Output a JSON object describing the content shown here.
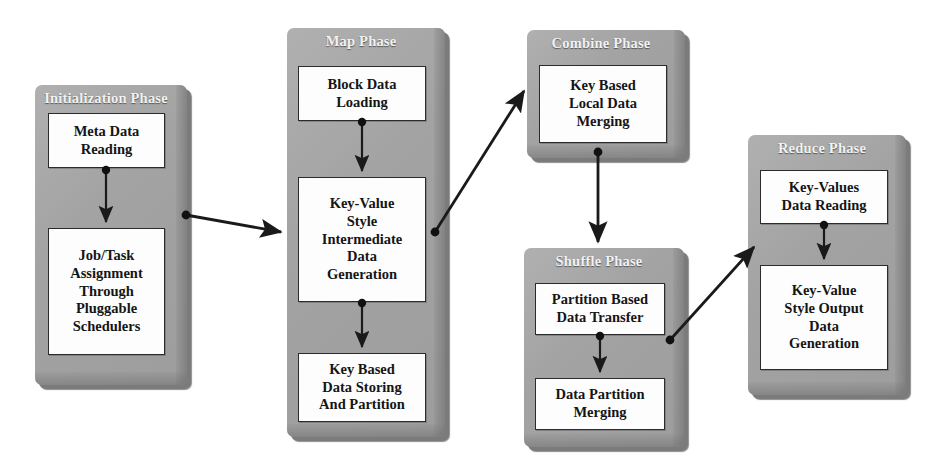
{
  "diagram": {
    "background_color": "#ffffff",
    "panel_color": "#a8a8a8",
    "panel_shadow_color": "#7b7b7b",
    "node_fill_color": "#fdfdfd",
    "node_border_color": "#2b2b2b",
    "arrow_color": "#1a1a1a",
    "title_text_color": "#f2f2f2"
  },
  "phases": [
    {
      "id": "initialization",
      "title": "Initialization Phase",
      "nodes": [
        {
          "id": "meta-data-reading",
          "label": "Meta Data\nReading"
        },
        {
          "id": "job-task-assignment",
          "label": "Job/Task\nAssignment\nThrough\nPluggable\nSchedulers"
        }
      ]
    },
    {
      "id": "map",
      "title": "Map Phase",
      "nodes": [
        {
          "id": "block-data-loading",
          "label": "Block Data\nLoading"
        },
        {
          "id": "key-value-intermediate",
          "label": "Key-Value\nStyle\nIntermediate\nData\nGeneration"
        },
        {
          "id": "key-based-data-storing",
          "label": "Key Based\nData Storing\nAnd Partition"
        }
      ]
    },
    {
      "id": "combine",
      "title": "Combine Phase",
      "nodes": [
        {
          "id": "key-based-local-merging",
          "label": "Key Based\nLocal Data\nMerging"
        }
      ]
    },
    {
      "id": "shuffle",
      "title": "Shuffle Phase",
      "nodes": [
        {
          "id": "partition-based-transfer",
          "label": "Partition Based\nData Transfer"
        },
        {
          "id": "data-partition-merging",
          "label": "Data Partition\nMerging"
        }
      ]
    },
    {
      "id": "reduce",
      "title": "Reduce Phase",
      "nodes": [
        {
          "id": "key-values-data-reading",
          "label": "Key-Values\nData Reading"
        },
        {
          "id": "key-value-output-generation",
          "label": "Key-Value\nStyle Output\nData\nGeneration"
        }
      ]
    }
  ],
  "connections": [
    {
      "id": "init-to-map",
      "from": "job-task-assignment",
      "to": "key-value-intermediate",
      "kind": "inter-phase"
    },
    {
      "id": "map-to-combine",
      "from": "key-value-intermediate",
      "to": "key-based-local-merging",
      "kind": "inter-phase"
    },
    {
      "id": "combine-to-shuffle",
      "from": "key-based-local-merging",
      "to": "partition-based-transfer",
      "kind": "inter-phase"
    },
    {
      "id": "shuffle-to-reduce",
      "from": "partition-based-transfer",
      "to": "key-values-data-reading",
      "kind": "inter-phase"
    },
    {
      "id": "meta-to-job",
      "from": "meta-data-reading",
      "to": "job-task-assignment",
      "kind": "intra-phase"
    },
    {
      "id": "block-to-keyvalue",
      "from": "block-data-loading",
      "to": "key-value-intermediate",
      "kind": "intra-phase"
    },
    {
      "id": "keyvalue-to-keybased",
      "from": "key-value-intermediate",
      "to": "key-based-data-storing",
      "kind": "intra-phase"
    },
    {
      "id": "partition-to-merging",
      "from": "partition-based-transfer",
      "to": "data-partition-merging",
      "kind": "intra-phase"
    },
    {
      "id": "keyvalues-to-output",
      "from": "key-values-data-reading",
      "to": "key-value-output-generation",
      "kind": "intra-phase"
    }
  ]
}
